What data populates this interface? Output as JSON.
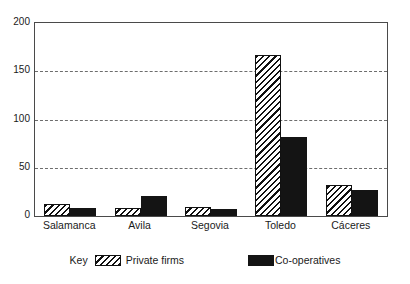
{
  "chart_data": {
    "type": "bar",
    "title": "",
    "subtitle": "",
    "xlabel": "",
    "ylabel": "",
    "categories": [
      "Salamanca",
      "Avila",
      "Segovia",
      "Toledo",
      "Cáceres"
    ],
    "series": [
      {
        "name": "Private firms",
        "pattern": "diagonal-hatch",
        "values": [
          12,
          8,
          9,
          167,
          32
        ]
      },
      {
        "name": "Co-operatives",
        "pattern": "solid-black",
        "values": [
          8,
          21,
          7,
          82,
          27
        ]
      }
    ],
    "ylim": [
      0,
      200
    ],
    "yticks": [
      0,
      50,
      100,
      150,
      200
    ],
    "ytick_labels": [
      "0",
      "50",
      "100",
      "150",
      "200"
    ],
    "grid": true,
    "grid_style": "dashed-horizontal",
    "legend_position": "bottom-center",
    "legend_prefix": "Key"
  },
  "legend": {
    "key_word": "Key",
    "entries": [
      {
        "label": "Private firms"
      },
      {
        "label": "Co-operatives"
      }
    ]
  },
  "colors": {
    "axis": "#4a4a4a",
    "grid": "#6d6d6d",
    "private_firms": "#ffffff",
    "co_operatives": "#141414",
    "text": "#1a1a1a",
    "background": "#ffffff"
  }
}
